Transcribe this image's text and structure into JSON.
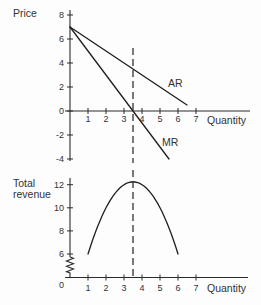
{
  "chart_data": [
    {
      "id": "price-chart",
      "type": "line",
      "title": "",
      "ylabel": "Price",
      "ylabel_lines": [
        "Price"
      ],
      "xlabel": "Quantity",
      "xlim": [
        0,
        7
      ],
      "ylim": [
        -4,
        8
      ],
      "xticks": [
        1,
        2,
        3,
        4,
        5,
        6,
        7
      ],
      "yticks": [
        8,
        6,
        4,
        2,
        0,
        -2,
        -4
      ],
      "grid": false,
      "legend": "none",
      "series": [
        {
          "name": "AR",
          "x": [
            0,
            6.5
          ],
          "y": [
            7,
            0.5
          ]
        },
        {
          "name": "MR",
          "x": [
            0,
            5.5
          ],
          "y": [
            7,
            -4
          ]
        }
      ],
      "annotations": [
        {
          "text": "AR",
          "x": 5.44,
          "y": 2.0
        },
        {
          "text": "MR",
          "x": 5.11,
          "y": -2.92
        }
      ],
      "vline": {
        "x": 3.5,
        "style": "dashed"
      }
    },
    {
      "id": "revenue-chart",
      "type": "line",
      "title": "",
      "ylabel": "Total revenue",
      "ylabel_lines": [
        "Total",
        "revenue"
      ],
      "xlabel": "Quantity",
      "xlim": [
        0,
        7
      ],
      "ylim": [
        0,
        12
      ],
      "axis_break": [
        0,
        6
      ],
      "origin_label": "0",
      "xticks": [
        1,
        2,
        3,
        4,
        5,
        6,
        7
      ],
      "yticks": [
        12,
        10,
        8,
        6
      ],
      "grid": false,
      "legend": "none",
      "series": [
        {
          "name": "Total revenue",
          "x": [
            1,
            1.5,
            2,
            2.5,
            3,
            3.5,
            4,
            4.5,
            5,
            5.5,
            6
          ],
          "y": [
            6,
            8.25,
            10,
            11.25,
            12,
            12.25,
            12,
            11.25,
            10,
            8.25,
            6
          ]
        }
      ],
      "annotations": [],
      "vline": {
        "x": 3.5,
        "style": "dashed"
      }
    }
  ]
}
